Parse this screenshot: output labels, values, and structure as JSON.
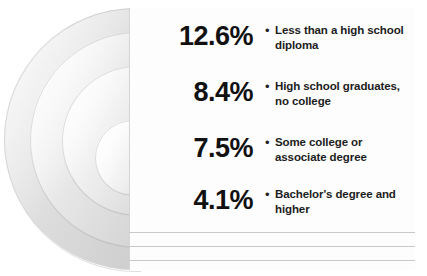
{
  "figure": {
    "bullet_glyph": "•"
  },
  "rows": [
    {
      "percent": "12.6%",
      "label": "Less than a high school diploma"
    },
    {
      "percent": "8.4%",
      "label": "High school graduates, no college"
    },
    {
      "percent": "7.5%",
      "label": "Some college or associate degree"
    },
    {
      "percent": "4.1%",
      "label": "Bachelor's degree and higher"
    }
  ],
  "colors": {
    "text": "#111111",
    "panel": "#fdfdfd",
    "band_light": "#f3f3f3",
    "band_dark": "#cdcdcd",
    "hairline": "#c9c9c9"
  },
  "chart_data": {
    "type": "bar",
    "categories": [
      "Less than a high school diploma",
      "High school graduates, no college",
      "Some college or associate degree",
      "Bachelor's degree and higher"
    ],
    "values": [
      12.6,
      8.4,
      7.5,
      4.1
    ],
    "xlabel": "",
    "ylabel": "Unemployment rate (%)",
    "ylim": [
      0,
      13
    ],
    "grid": false,
    "legend": "none",
    "units": "percent"
  }
}
